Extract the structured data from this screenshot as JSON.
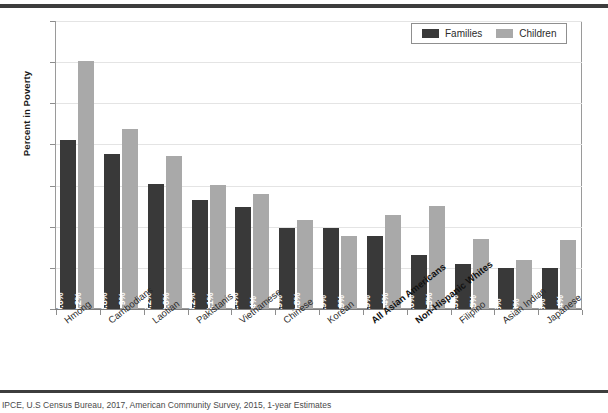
{
  "chart_data": {
    "type": "bar",
    "title": "",
    "xlabel": "",
    "ylabel": "Percent in Poverty",
    "ylim": [
      0,
      35
    ],
    "yticks": [
      0,
      5,
      10,
      15,
      20,
      25,
      30,
      35
    ],
    "grid": true,
    "legend_position": "top-right",
    "categories": [
      "Hmong",
      "Cambodians",
      "Laotian",
      "Pakistanis",
      "Vietnamese",
      "Chinese",
      "Korean",
      "All Asian Americans",
      "Non-Hispanic Whites",
      "Filipino",
      "Asian Indian",
      "Japanese"
    ],
    "category_emphasis": [
      false,
      false,
      false,
      false,
      false,
      false,
      false,
      true,
      true,
      false,
      false,
      false
    ],
    "series": [
      {
        "name": "Families",
        "color": "#393939",
        "values": [
          20.6,
          18.8,
          15.2,
          13.2,
          12.4,
          9.9,
          9.9,
          8.9,
          6.6,
          5.5,
          5,
          5
        ],
        "labels": [
          "20.6%",
          "18.8%",
          "15.2%",
          "13.2%",
          "12.4%",
          "9.9%",
          "9.9%",
          "8.9%",
          "6.6%",
          "5.5%",
          "5%",
          "5%"
        ]
      },
      {
        "name": "Children",
        "color": "#a9a9a9",
        "values": [
          30.2,
          21.9,
          18.6,
          15.1,
          14,
          10.8,
          8.9,
          11.4,
          12.5,
          8.5,
          6,
          8.4
        ],
        "labels": [
          "30.2%",
          "21.9%",
          "18.6%",
          "15.1%",
          "14%",
          "10.8%",
          "8.9%",
          "11.4%",
          "12.5%",
          "8.5%",
          "6%",
          "8.4%"
        ]
      }
    ]
  },
  "legend": {
    "items": [
      {
        "label": "Families"
      },
      {
        "label": "Children"
      }
    ]
  },
  "footer": {
    "source": "IPCE, U.S Census Bureau, 2017, American Community Survey, 2015, 1-year Estimates"
  }
}
